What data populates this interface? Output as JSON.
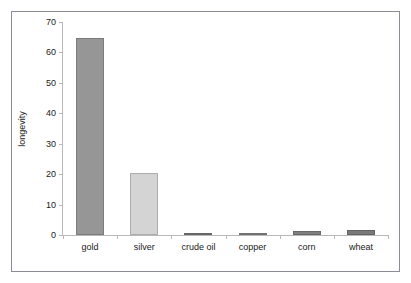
{
  "figure": {
    "background_color": "#ffffff",
    "frame_color": "#8c8c96",
    "axis_color": "#b9b9bd"
  },
  "chart_data": {
    "type": "bar",
    "title": "",
    "subtitle": "",
    "xlabel": "",
    "ylabel": "longevity",
    "categories": [
      "gold",
      "silver",
      "crude oil",
      "copper",
      "corn",
      "wheat"
    ],
    "values": [
      64.8,
      20.3,
      0.4,
      0.35,
      1.2,
      1.6
    ],
    "series": [
      {
        "name": "longevity",
        "values": [
          64.8,
          20.3,
          0.4,
          0.35,
          1.2,
          1.6
        ]
      }
    ],
    "bar_colors": [
      "#969696",
      "#d4d4d4",
      "#7d7d7d",
      "#8a8a8a",
      "#808080",
      "#7a7a7a"
    ],
    "ylim": [
      0,
      70
    ],
    "yticks": [
      0,
      10,
      20,
      30,
      40,
      50,
      60,
      70
    ],
    "ytick_labels": [
      "0",
      "10",
      "20",
      "30",
      "40",
      "50",
      "60",
      "70"
    ],
    "grid": false,
    "legend": false,
    "legend_position": "none"
  }
}
